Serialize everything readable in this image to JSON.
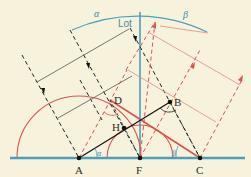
{
  "diagram": {
    "labels": {
      "A": "A",
      "F": "F",
      "C": "C",
      "D": "D",
      "B": "B",
      "H": "H",
      "lot": "Lot",
      "alpha_top": "α",
      "beta_top": "β",
      "alpha_bottom": "α",
      "beta_bottom": "β"
    },
    "colors": {
      "background": "#f7f2dc",
      "baseline": "#4a9ec0",
      "normal": "#4a9ec0",
      "incident": "#222222",
      "refracted": "#d9534f",
      "red_light": "#e08a80",
      "segment_AB": "#111111",
      "point": "#111111"
    }
  }
}
